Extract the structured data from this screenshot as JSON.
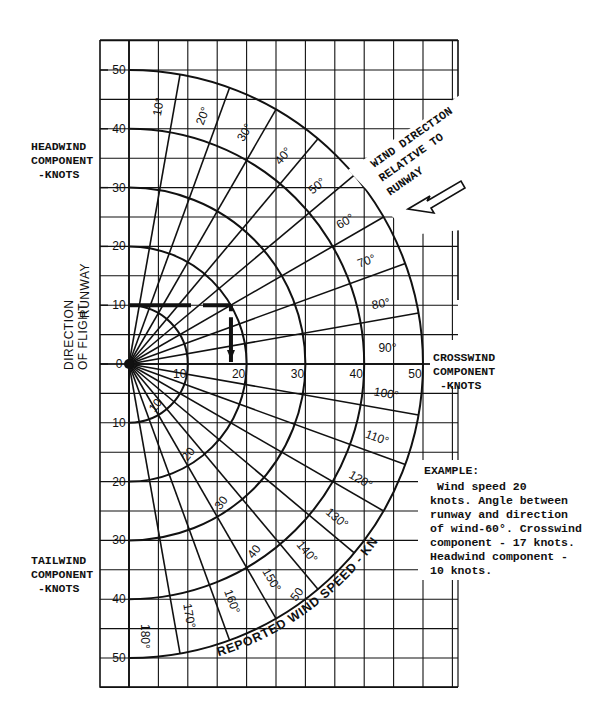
{
  "chart_data": {
    "type": "polar-wind-component-chart",
    "x_axis": {
      "label": "CROSSWIND COMPONENT -KNOTS",
      "ticks": [
        0,
        10,
        20,
        30,
        40,
        50
      ]
    },
    "y_axis": {
      "label_top": "HEADWIND COMPONENT -KNOTS",
      "label_bottom": "TAILWIND COMPONENT -KNOTS",
      "side_label": [
        "DIRECTION OF FLIGHT",
        "RUNWAY"
      ],
      "ticks_headwind": [
        50,
        40,
        30,
        20,
        10,
        0
      ],
      "ticks_tailwind": [
        10,
        20,
        30,
        40,
        50
      ]
    },
    "wind_speed_arcs_knots": [
      10,
      20,
      30,
      40,
      50
    ],
    "wind_speed_arc_label": "REPORTED WIND SPEED - KNOTS",
    "angle_rays_deg": [
      10,
      20,
      30,
      40,
      50,
      60,
      70,
      80,
      90,
      100,
      110,
      120,
      130,
      140,
      150,
      160,
      170,
      180
    ],
    "direction_annotation": "WIND DIRECTION RELATIVE TO RUNWAY",
    "example": {
      "wind_speed_knots": 20,
      "angle_deg": 60,
      "crosswind_knots": 17,
      "headwind_knots": 10
    },
    "grid": true
  },
  "labels": {
    "headwind": "HEADWIND\nCOMPONENT\n -KNOTS",
    "tailwind": "TAILWIND\nCOMPONENT\n -KNOTS",
    "crosswind": "CROSSWIND\nCOMPONENT\n -KNOTS",
    "direction_of_flight": "DIRECTION OF FLIGHT",
    "runway": "RUNWAY",
    "wind_direction": [
      "WIND DIRECTION",
      "RELATIVE TO",
      "RUNWAY"
    ],
    "example_title": "EXAMPLE:",
    "example_text": " Wind speed 20\nknots. Angle between\nrunway and direction\nof wind-60°. Crosswind\ncomponent - 17 knots.\nHeadwind component -\n10 knots.",
    "reported_wind_speed": "REPORTED WIND SPEED - KNOTS"
  }
}
